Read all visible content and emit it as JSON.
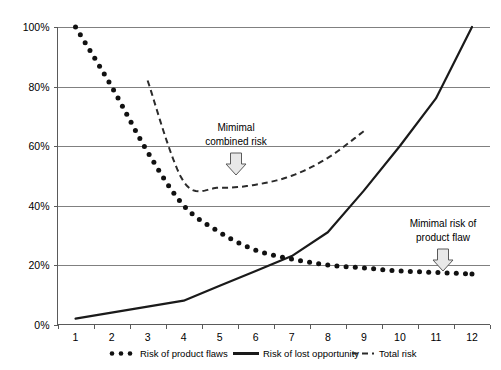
{
  "chart_data": {
    "type": "line",
    "title": "",
    "xlabel": "",
    "ylabel": "",
    "ylim": [
      0,
      100
    ],
    "ytick_labels": [
      "0%",
      "20%",
      "40%",
      "60%",
      "80%",
      "100%"
    ],
    "ytick_values": [
      0,
      20,
      40,
      60,
      80,
      100
    ],
    "categories": [
      "1",
      "2",
      "3",
      "4",
      "5",
      "6",
      "7",
      "8",
      "9",
      "10",
      "11",
      "12"
    ],
    "x": [
      1,
      2,
      3,
      4,
      5,
      6,
      7,
      8,
      9,
      10,
      11,
      12
    ],
    "grid": true,
    "legend_position": "bottom",
    "series": [
      {
        "name": "Risk of product flaws",
        "style": "dotted",
        "x": [
          1,
          2,
          3,
          4,
          5,
          6,
          7,
          8,
          9,
          10,
          11,
          12
        ],
        "values": [
          100,
          80,
          58,
          40,
          31,
          25,
          22,
          20,
          19,
          18,
          17.5,
          17
        ]
      },
      {
        "name": "Risk of lost opportunity",
        "style": "solid",
        "x": [
          1,
          2,
          3,
          4,
          5,
          6,
          7,
          8,
          9,
          10,
          11,
          12
        ],
        "values": [
          2,
          4,
          6,
          8,
          13,
          18,
          23,
          31,
          45,
          60,
          76,
          100
        ]
      },
      {
        "name": "Total risk",
        "style": "dashed",
        "x": [
          3,
          4,
          5,
          6,
          7,
          8,
          9
        ],
        "values": [
          82,
          48,
          46,
          47,
          50,
          56,
          65
        ]
      }
    ],
    "annotations": [
      {
        "id": "minimal-combined-risk",
        "lines": [
          "Mimimal",
          "combined risk"
        ],
        "text": "Mimimal combined risk",
        "marker": "down-arrow",
        "points_to_series": "Total risk",
        "points_to_x": 5.5
      },
      {
        "id": "minimal-product-flaw-risk",
        "lines": [
          "Mimimal risk of",
          "product flaw"
        ],
        "text": "Mimimal risk of product flaw",
        "marker": "down-arrow",
        "points_to_series": "Risk of product flaws",
        "points_to_x": 11.3
      }
    ],
    "colors": {
      "series_line": "#1a1a1a",
      "gridline": "#808080",
      "axis": "#5a5a5a",
      "arrow_fill": "#e8e8e8",
      "background": "#ffffff"
    }
  }
}
